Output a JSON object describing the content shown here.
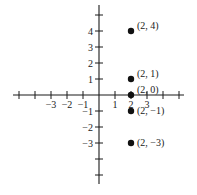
{
  "chart_data": {
    "type": "scatter",
    "title": "",
    "xlabel": "",
    "ylabel": "",
    "xlim": [
      -5.5,
      5.5
    ],
    "ylim": [
      -5.5,
      5.5
    ],
    "grid": false,
    "legend": null,
    "x_tick_positions": [
      -5,
      -4,
      -3,
      -2,
      -1,
      1,
      2,
      3,
      4,
      5
    ],
    "x_tick_labels": [
      {
        "value": -3,
        "label": "−3"
      },
      {
        "value": -2,
        "label": "−2"
      },
      {
        "value": -1,
        "label": "−1"
      },
      {
        "value": 1,
        "label": "1"
      },
      {
        "value": 2,
        "label": "2"
      },
      {
        "value": 3,
        "label": "3"
      }
    ],
    "y_tick_positions": [
      -5,
      -4,
      -3,
      -2,
      -1,
      1,
      2,
      3,
      4,
      5
    ],
    "y_tick_labels": [
      {
        "value": 4,
        "label": "4"
      },
      {
        "value": 3,
        "label": "3"
      },
      {
        "value": 2,
        "label": "2"
      },
      {
        "value": 1,
        "label": "1"
      },
      {
        "value": -1,
        "label": "−1"
      },
      {
        "value": -2,
        "label": "−2"
      },
      {
        "value": -3,
        "label": "−3"
      }
    ],
    "series": [
      {
        "name": "points",
        "color": "#111111",
        "points": [
          {
            "x": 2,
            "y": 4,
            "label": "(2, 4)"
          },
          {
            "x": 2,
            "y": 1,
            "label": "(2, 1)"
          },
          {
            "x": 2,
            "y": 0,
            "label": "(2, 0)"
          },
          {
            "x": 2,
            "y": -1,
            "label": "(2, −1)"
          },
          {
            "x": 2,
            "y": -3,
            "label": "(2, −3)"
          }
        ]
      }
    ]
  },
  "style": {
    "axis_color": "#1a1a1a",
    "point_color": "#111111",
    "background": "#ffffff"
  }
}
